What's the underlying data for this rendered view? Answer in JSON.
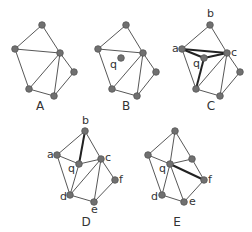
{
  "diagram": {
    "panels": [
      {
        "label": "A",
        "nodes": [
          {
            "id": "t",
            "x": 42,
            "y": 25
          },
          {
            "id": "l",
            "x": 15,
            "y": 49
          },
          {
            "id": "r",
            "x": 60,
            "y": 53
          },
          {
            "id": "fr",
            "x": 74,
            "y": 72
          },
          {
            "id": "bl",
            "x": 29,
            "y": 89
          },
          {
            "id": "br",
            "x": 54,
            "y": 96
          }
        ],
        "edges": [
          [
            "t",
            "l"
          ],
          [
            "t",
            "r"
          ],
          [
            "l",
            "r"
          ],
          [
            "l",
            "bl"
          ],
          [
            "r",
            "bl"
          ],
          [
            "r",
            "br"
          ],
          [
            "r",
            "fr"
          ],
          [
            "fr",
            "br"
          ],
          [
            "bl",
            "br"
          ]
        ],
        "bold_edges": [],
        "vertex_labels": []
      },
      {
        "label": "B",
        "nodes": [
          {
            "id": "t",
            "x": 126,
            "y": 25
          },
          {
            "id": "l",
            "x": 98,
            "y": 49
          },
          {
            "id": "r",
            "x": 143,
            "y": 53
          },
          {
            "id": "fr",
            "x": 156,
            "y": 72
          },
          {
            "id": "bl",
            "x": 112,
            "y": 89
          },
          {
            "id": "br",
            "x": 137,
            "y": 96
          },
          {
            "id": "q",
            "x": 121,
            "y": 58
          }
        ],
        "edges": [
          [
            "t",
            "l"
          ],
          [
            "t",
            "r"
          ],
          [
            "l",
            "r"
          ],
          [
            "l",
            "bl"
          ],
          [
            "r",
            "bl"
          ],
          [
            "r",
            "br"
          ],
          [
            "r",
            "fr"
          ],
          [
            "fr",
            "br"
          ],
          [
            "bl",
            "br"
          ]
        ],
        "bold_edges": [],
        "vertex_labels": [
          {
            "text": "q",
            "x": 110,
            "y": 68
          }
        ]
      },
      {
        "label": "C",
        "nodes": [
          {
            "id": "b",
            "x": 210,
            "y": 25
          },
          {
            "id": "a",
            "x": 182,
            "y": 49
          },
          {
            "id": "c",
            "x": 227,
            "y": 53
          },
          {
            "id": "fr",
            "x": 240,
            "y": 72
          },
          {
            "id": "bl",
            "x": 196,
            "y": 89
          },
          {
            "id": "br",
            "x": 220,
            "y": 96
          },
          {
            "id": "q",
            "x": 204,
            "y": 58
          }
        ],
        "edges": [
          [
            "b",
            "a"
          ],
          [
            "b",
            "c"
          ],
          [
            "a",
            "bl"
          ],
          [
            "c",
            "bl"
          ],
          [
            "c",
            "br"
          ],
          [
            "c",
            "fr"
          ],
          [
            "fr",
            "br"
          ],
          [
            "bl",
            "br"
          ]
        ],
        "bold_edges": [
          [
            "a",
            "c"
          ],
          [
            "a",
            "q"
          ],
          [
            "q",
            "c"
          ],
          [
            "q",
            "bl"
          ]
        ],
        "vertex_labels": [
          {
            "text": "b",
            "x": 207,
            "y": 17
          },
          {
            "text": "a",
            "x": 172,
            "y": 52
          },
          {
            "text": "c",
            "x": 231,
            "y": 56
          },
          {
            "text": "q",
            "x": 193,
            "y": 67
          }
        ]
      },
      {
        "label": "D",
        "nodes": [
          {
            "id": "b",
            "x": 85,
            "y": 131
          },
          {
            "id": "a",
            "x": 57,
            "y": 155
          },
          {
            "id": "q",
            "x": 79,
            "y": 164
          },
          {
            "id": "c",
            "x": 101,
            "y": 159
          },
          {
            "id": "f",
            "x": 115,
            "y": 180
          },
          {
            "id": "d",
            "x": 70,
            "y": 195
          },
          {
            "id": "e",
            "x": 94,
            "y": 202
          }
        ],
        "edges": [
          [
            "b",
            "a"
          ],
          [
            "b",
            "c"
          ],
          [
            "a",
            "q"
          ],
          [
            "q",
            "c"
          ],
          [
            "a",
            "d"
          ],
          [
            "q",
            "d"
          ],
          [
            "c",
            "d"
          ],
          [
            "c",
            "e"
          ],
          [
            "c",
            "f"
          ],
          [
            "f",
            "e"
          ],
          [
            "d",
            "e"
          ]
        ],
        "bold_edges": [
          [
            "b",
            "q"
          ]
        ],
        "vertex_labels": [
          {
            "text": "b",
            "x": 82,
            "y": 124
          },
          {
            "text": "a",
            "x": 47,
            "y": 158
          },
          {
            "text": "q",
            "x": 68,
            "y": 172
          },
          {
            "text": "c",
            "x": 105,
            "y": 161
          },
          {
            "text": "f",
            "x": 119,
            "y": 183
          },
          {
            "text": "d",
            "x": 60,
            "y": 200
          },
          {
            "text": "e",
            "x": 91,
            "y": 213
          }
        ]
      },
      {
        "label": "E",
        "nodes": [
          {
            "id": "b",
            "x": 175,
            "y": 131
          },
          {
            "id": "a",
            "x": 148,
            "y": 155
          },
          {
            "id": "q",
            "x": 170,
            "y": 164
          },
          {
            "id": "c",
            "x": 192,
            "y": 159
          },
          {
            "id": "f",
            "x": 204,
            "y": 180
          },
          {
            "id": "d",
            "x": 162,
            "y": 195
          },
          {
            "id": "e",
            "x": 184,
            "y": 202
          }
        ],
        "edges": [
          [
            "b",
            "a"
          ],
          [
            "b",
            "c"
          ],
          [
            "b",
            "q"
          ],
          [
            "a",
            "q"
          ],
          [
            "q",
            "c"
          ],
          [
            "a",
            "d"
          ],
          [
            "q",
            "d"
          ],
          [
            "q",
            "e"
          ],
          [
            "c",
            "f"
          ],
          [
            "f",
            "e"
          ],
          [
            "d",
            "e"
          ]
        ],
        "bold_edges": [
          [
            "q",
            "f"
          ]
        ],
        "vertex_labels": [
          {
            "text": "q",
            "x": 159,
            "y": 172
          },
          {
            "text": "f",
            "x": 208,
            "y": 183
          },
          {
            "text": "d",
            "x": 151,
            "y": 200
          },
          {
            "text": "e",
            "x": 189,
            "y": 205
          }
        ]
      }
    ],
    "panel_label_positions": {
      "A": {
        "x": 40,
        "y": 110
      },
      "B": {
        "x": 126,
        "y": 110
      },
      "C": {
        "x": 211,
        "y": 110
      },
      "D": {
        "x": 86,
        "y": 226
      },
      "E": {
        "x": 177,
        "y": 226
      }
    }
  }
}
